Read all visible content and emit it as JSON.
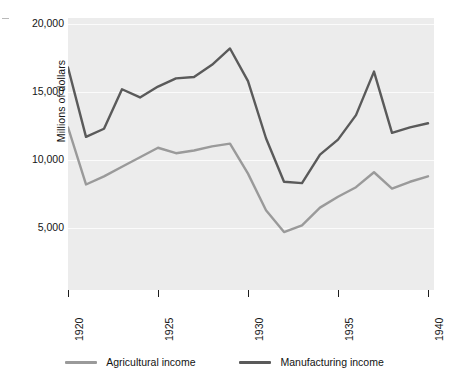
{
  "chart_data": {
    "type": "line",
    "title": "",
    "xlabel": "",
    "ylabel": "Millions of dollars",
    "xlim": [
      1920,
      1940
    ],
    "ylim": [
      0,
      20000
    ],
    "xticks": [
      1920,
      1925,
      1930,
      1935,
      1940
    ],
    "xticklabels": [
      "1920",
      "1925",
      "1930",
      "1935",
      "1940"
    ],
    "yticks": [
      5000,
      10000,
      15000,
      20000
    ],
    "yticklabels": [
      "5,000",
      "10,000",
      "15,000",
      "20,000"
    ],
    "grid": "horizontal",
    "legend_position": "bottom",
    "plot_background": "#ececec",
    "x": [
      1920,
      1921,
      1922,
      1923,
      1924,
      1925,
      1926,
      1927,
      1928,
      1929,
      1930,
      1931,
      1932,
      1933,
      1934,
      1935,
      1936,
      1937,
      1938,
      1939,
      1940
    ],
    "series": [
      {
        "name": "Agricultural income",
        "color": "#9a9a9a",
        "values": [
          12400,
          8200,
          8800,
          9500,
          10200,
          10900,
          10500,
          10700,
          11000,
          11200,
          9000,
          6300,
          4700,
          5200,
          6500,
          7300,
          8000,
          9100,
          7900,
          8400,
          8800
        ]
      },
      {
        "name": "Manufacturing income",
        "color": "#5a5a5a",
        "values": [
          16800,
          11700,
          12300,
          15200,
          14600,
          15400,
          16000,
          16100,
          17000,
          18200,
          15800,
          11600,
          8400,
          8300,
          10400,
          11500,
          13300,
          16500,
          12000,
          12400,
          12700
        ]
      }
    ]
  },
  "legend": {
    "items": [
      {
        "label": "Agricultural income",
        "color": "#9a9a9a"
      },
      {
        "label": "Manufacturing income",
        "color": "#5a5a5a"
      }
    ]
  }
}
